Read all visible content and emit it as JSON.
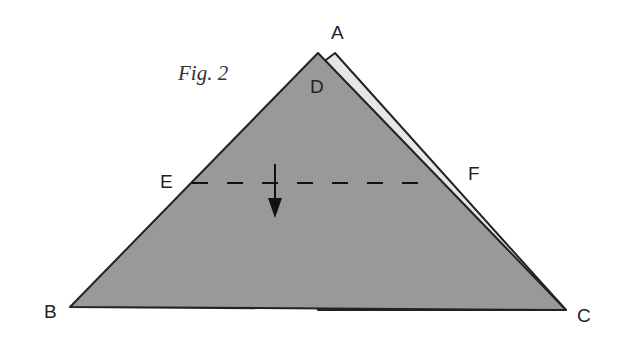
{
  "figure": {
    "caption": "Fig. 2",
    "labels": {
      "A": "A",
      "B": "B",
      "C": "C",
      "D": "D",
      "E": "E",
      "F": "F"
    },
    "colors": {
      "front_fill": "#999999",
      "back_flap_fill": "#e6e6e6",
      "outline": "#222222",
      "text": "#222222"
    },
    "fold_line": "dashed",
    "arrow_direction": "down"
  }
}
